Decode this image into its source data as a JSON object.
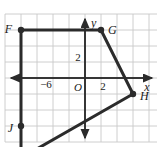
{
  "figure": {
    "type": "coordinate-grid-polygon",
    "colors": {
      "grid": "#c8c8c8",
      "axis": "#2b2b2b",
      "polygon": "#2b2b2b",
      "background": "#ffffff",
      "text": "#1a1a1a"
    },
    "grid": {
      "cell_size_px": 16,
      "origin_px": {
        "x": 85,
        "y": 78
      },
      "x_min": -5,
      "x_max": 4,
      "y_min": -5,
      "y_max": 4,
      "visible": true
    },
    "axes": {
      "x": {
        "label": "x",
        "arrow_both_ends": true
      },
      "y": {
        "label": "y",
        "arrow_both_ends": true
      },
      "origin_label": "O"
    },
    "tick_labels": [
      {
        "name": "x-tick-negative-six",
        "text": "−6",
        "x_px": 46,
        "y_px": 84
      },
      {
        "name": "x-tick-two",
        "text": "2",
        "x_px": 103,
        "y_px": 84
      },
      {
        "name": "y-tick-two",
        "text": "2",
        "x_px": 78,
        "y_px": 59
      }
    ],
    "polygon": {
      "name": "quadrilateral-FGHJ",
      "closed": true,
      "vertices": [
        {
          "label": "F",
          "x": -4,
          "y": 3,
          "label_side": "left"
        },
        {
          "label": "G",
          "x": 1,
          "y": 3,
          "label_side": "right"
        },
        {
          "label": "H",
          "x": 3,
          "y": -1,
          "label_side": "right"
        },
        {
          "label": "J",
          "x": -4,
          "y": -5,
          "label_side": "left"
        }
      ]
    }
  }
}
